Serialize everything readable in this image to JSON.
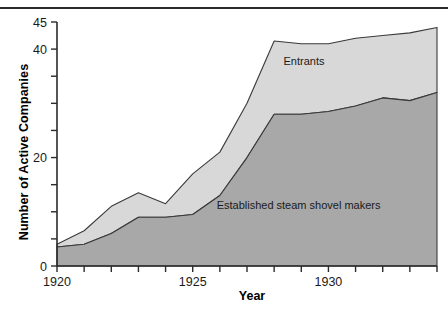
{
  "figure": {
    "has_top_rule": true,
    "background": "#ffffff"
  },
  "chart_data": {
    "type": "area",
    "stacked": true,
    "title": "",
    "xlabel": "Year",
    "ylabel": "Number of Active Companies",
    "xlim": [
      1920,
      1934
    ],
    "ylim": [
      0,
      45
    ],
    "xticks": [
      1920,
      1921,
      1922,
      1923,
      1924,
      1925,
      1926,
      1927,
      1928,
      1929,
      1930,
      1931,
      1932,
      1933,
      1934
    ],
    "xtick_labels": [
      "1920",
      "",
      "",
      "",
      "",
      "1925",
      "",
      "",
      "",
      "",
      "1930",
      "",
      "",
      "",
      ""
    ],
    "yticks": [
      0,
      5,
      10,
      15,
      20,
      25,
      30,
      35,
      40,
      45
    ],
    "ytick_labels": [
      "0",
      "",
      "",
      "",
      "20",
      "",
      "",
      "",
      "40",
      "45"
    ],
    "grid": false,
    "legend_position": "inline-annotations",
    "x": [
      1920,
      1921,
      1922,
      1923,
      1924,
      1925,
      1926,
      1927,
      1928,
      1929,
      1930,
      1931,
      1932,
      1933,
      1934
    ],
    "series": [
      {
        "name": "Established steam shovel makers",
        "color": "#a8a8a8",
        "values": [
          3.5,
          4,
          6,
          9,
          9,
          9.5,
          13,
          20,
          28,
          28,
          28.5,
          29.5,
          31,
          30.5,
          32
        ]
      },
      {
        "name": "Entrants",
        "color": "#d8d8d8",
        "values": [
          0.5,
          2.5,
          5,
          4.5,
          2.5,
          7.5,
          8,
          10,
          13.5,
          13,
          12.5,
          12.5,
          11.5,
          12.5,
          12
        ]
      }
    ],
    "totals": [
      4,
      6.5,
      11,
      13.5,
      11.5,
      17,
      21,
      30,
      41.5,
      41,
      41,
      42,
      42.5,
      43,
      44
    ],
    "annotations": [
      {
        "label": "Entrants",
        "x": 1929.1,
        "y": 37.0
      },
      {
        "label": "Established steam shovel makers",
        "x": 1928.9,
        "y": 10.5
      }
    ],
    "axis_color": "#2b2b2b",
    "line_color": "#3a3a3a"
  }
}
